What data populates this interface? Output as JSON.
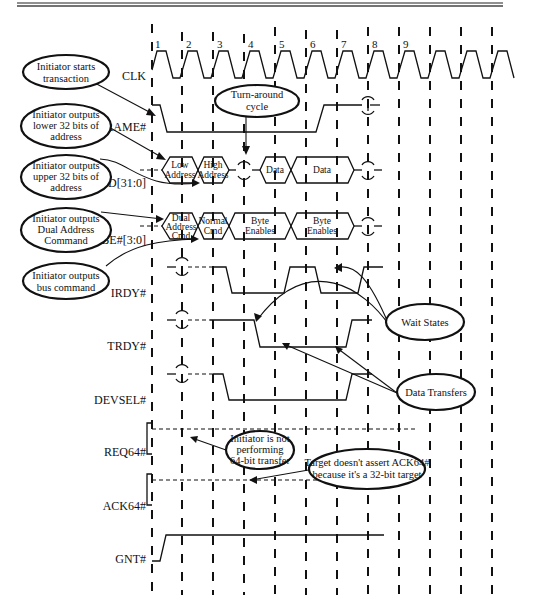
{
  "signals": {
    "clk": "CLK",
    "frame": "FRAME#",
    "ad": "AD[31:0]",
    "cbe": "C/BE#[3:0]",
    "irdy": "IRDY#",
    "trdy": "TRDY#",
    "devsel": "DEVSEL#",
    "req64": "REQ64#",
    "ack64": "ACK64#",
    "gnt": "GNT#"
  },
  "clock_numbers": [
    "1",
    "2",
    "3",
    "4",
    "5",
    "6",
    "7",
    "8",
    "9"
  ],
  "ad_bus": {
    "phase1_line1": "Low",
    "phase1_line2": "Address",
    "phase2_line1": "High",
    "phase2_line2": "Address",
    "data1": "Data",
    "data2": "Data"
  },
  "cbe_bus": {
    "phase1_line1": "Dual",
    "phase1_line2": "Address",
    "phase1_line3": "Cmd",
    "phase2_line1": "Normal",
    "phase2_line2": "Cmd",
    "be1_line1": "Byte",
    "be1_line2": "Enables",
    "be2_line1": "Byte",
    "be2_line2": "Enables"
  },
  "callouts": {
    "starts": [
      "Initiator starts",
      "transaction"
    ],
    "lower": [
      "Initiator outputs",
      "lower 32 bits of",
      "address"
    ],
    "upper": [
      "Initiator outputs",
      "upper 32 bits of",
      "address"
    ],
    "dual": [
      "Initiator outputs",
      "Dual Address",
      "Command"
    ],
    "buscmd": [
      "Initiator outputs",
      "bus command"
    ],
    "turnaround": [
      "Turn-around",
      "cycle"
    ],
    "wait": [
      "Wait States"
    ],
    "transfers": [
      "Data Transfers"
    ],
    "not64": [
      "Initiator is not",
      "performing",
      "64-bit transfer"
    ],
    "noack": [
      "Target doesn't assert ACK64#",
      "because it's a 32-bit target"
    ]
  }
}
